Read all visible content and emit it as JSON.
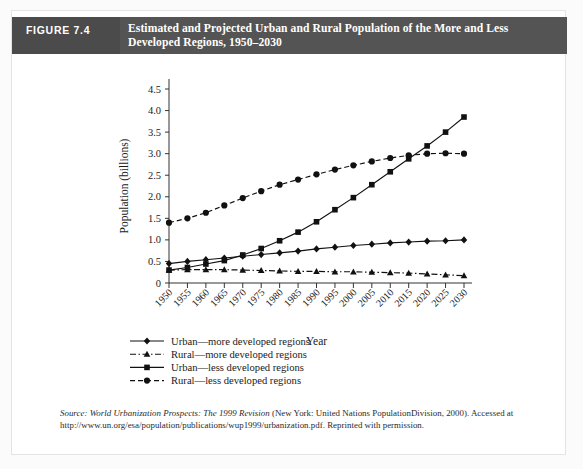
{
  "figure": {
    "number_label": "FIGURE 7.4",
    "title_line1": "Estimated and Projected Urban and Rural Population of the More and Less",
    "title_line2": "Developed Regions, 1950–2030",
    "header_bg": "#545454",
    "number_bg": "#4b4b4b",
    "title_color": "#ffffff"
  },
  "source_note": {
    "prefix": "Source:",
    "italic_title": "World Urbanization Prospects: The 1999 Revision",
    "rest": "(New York: United Nations PopulationDivision, 2000). Accessed at http://www.un.org/esa/population/publications/wup1999/urbanization.pdf. Reprinted with permission."
  },
  "chart_data": {
    "type": "line",
    "title": "Estimated and Projected Urban and Rural Population of the More and Less Developed Regions, 1950–2030",
    "xlabel": "Year",
    "ylabel": "Population (billions)",
    "x": [
      1950,
      1955,
      1960,
      1965,
      1970,
      1975,
      1980,
      1985,
      1990,
      1995,
      2000,
      2005,
      2010,
      2015,
      2020,
      2025,
      2030
    ],
    "xtick_labels": [
      "1950",
      "1955",
      "1960",
      "1965",
      "1970",
      "1975",
      "1980",
      "1985",
      "1990",
      "1995",
      "2000",
      "2005",
      "2010",
      "2015",
      "2020",
      "2025",
      "2030"
    ],
    "ytick_labels": [
      "0",
      "0.5",
      "1.0",
      "1.5",
      "2.0",
      "2.5",
      "3.0",
      "3.5",
      "4.0",
      "4.5"
    ],
    "ytick_values": [
      0,
      0.5,
      1.0,
      1.5,
      2.0,
      2.5,
      3.0,
      3.5,
      4.0,
      4.5
    ],
    "ylim": [
      0,
      4.5
    ],
    "xlim": [
      1950,
      2030
    ],
    "grid": false,
    "legend_position": "below-axis",
    "series": [
      {
        "name": "Urban—more developed regions",
        "marker": "diamond",
        "line_style": "solid",
        "color": "#111111",
        "values": [
          0.45,
          0.5,
          0.54,
          0.58,
          0.62,
          0.66,
          0.7,
          0.74,
          0.79,
          0.83,
          0.87,
          0.9,
          0.93,
          0.95,
          0.97,
          0.98,
          1.0
        ]
      },
      {
        "name": "Rural—more developed regions",
        "marker": "triangle",
        "line_style": "dashdot",
        "color": "#111111",
        "values": [
          0.3,
          0.31,
          0.31,
          0.31,
          0.3,
          0.29,
          0.28,
          0.27,
          0.27,
          0.26,
          0.26,
          0.25,
          0.24,
          0.23,
          0.21,
          0.19,
          0.17
        ]
      },
      {
        "name": "Urban—less developed regions",
        "marker": "square",
        "line_style": "solid",
        "color": "#111111",
        "values": [
          0.3,
          0.36,
          0.44,
          0.52,
          0.65,
          0.8,
          0.98,
          1.18,
          1.42,
          1.7,
          1.98,
          2.28,
          2.58,
          2.88,
          3.18,
          3.5,
          3.85
        ]
      },
      {
        "name": "Rural—less developed regions",
        "marker": "circle",
        "line_style": "dashed",
        "color": "#111111",
        "values": [
          1.4,
          1.5,
          1.63,
          1.8,
          1.97,
          2.13,
          2.28,
          2.4,
          2.52,
          2.63,
          2.73,
          2.82,
          2.9,
          2.96,
          3.0,
          3.01,
          3.0
        ]
      }
    ]
  }
}
